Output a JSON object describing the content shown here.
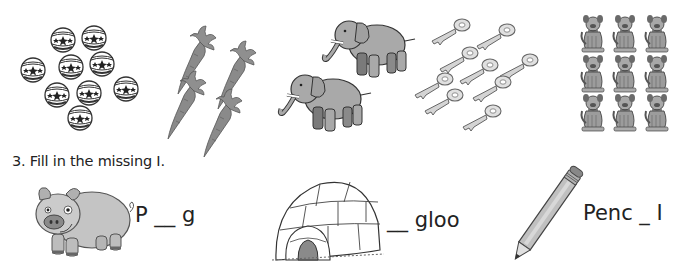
{
  "counting_row": {
    "groups": [
      {
        "name": "balls",
        "count": 9
      },
      {
        "name": "carrots",
        "count": 4
      },
      {
        "name": "elephants",
        "count": 2
      },
      {
        "name": "keys",
        "count": 9
      },
      {
        "name": "dogs",
        "count": 9
      }
    ]
  },
  "exercise3": {
    "number": "3.",
    "instruction": "3. Fill in the missing I.",
    "items": [
      {
        "picture": "pig",
        "word": "P __ g"
      },
      {
        "picture": "igloo",
        "word": "__ gloo"
      },
      {
        "picture": "pencil",
        "word": "Penc _ I"
      }
    ]
  },
  "colors": {
    "outline": "#333333",
    "gray_fill": "#9a9a9a",
    "light_gray": "#c8c8c8",
    "text": "#222222"
  }
}
